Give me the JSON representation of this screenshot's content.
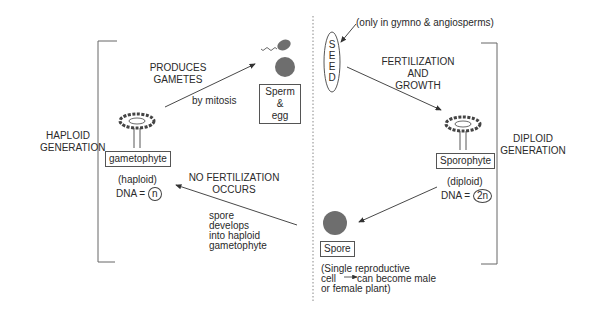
{
  "diagram": {
    "left_side": {
      "generation_label_line1": "HAPLOID",
      "generation_label_line2": "GENERATION",
      "organism_label": "gametophyte",
      "ploidy": "(haploid)",
      "dna_prefix": "DNA =",
      "dna_value": "n"
    },
    "right_side": {
      "generation_label_line1": "DIPLOID",
      "generation_label_line2": "GENERATION",
      "organism_label": "Sporophyte",
      "ploidy": "(diploid)",
      "dna_prefix": "DNA =",
      "dna_value": "2n"
    },
    "gametes": {
      "label_line1": "Sperm &",
      "label_line2": "egg"
    },
    "seed": {
      "letters": [
        "S",
        "E",
        "E",
        "D"
      ],
      "note": "(only in gymno & angiosperms)"
    },
    "spore": {
      "label": "Spore",
      "note_line1": "(Single reproductive",
      "note_line2_a": "cell",
      "note_line2_b": "can become male",
      "note_line3": "or female plant)"
    },
    "arrows": {
      "produces_gametes_line1": "PRODUCES",
      "produces_gametes_line2": "GAMETES",
      "by_mitosis": "by mitosis",
      "fertilization_line1": "FERTILIZATION",
      "fertilization_line2": "AND",
      "fertilization_line3": "GROWTH",
      "no_fertilization_line1": "NO FERTILIZATION",
      "no_fertilization_line2": "OCCURS",
      "spore_develops_line1": "spore",
      "spore_develops_line2": "develops",
      "spore_develops_line3": "into haploid",
      "spore_develops_line4": "gametophyte"
    },
    "colors": {
      "line": "#555555",
      "cell_fill": "#6e6e6e",
      "text": "#2a2a2a"
    }
  }
}
